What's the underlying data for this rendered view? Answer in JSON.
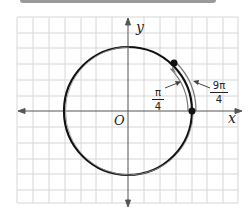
{
  "diagram": {
    "type": "unit-circle-angle",
    "axes": {
      "x_label": "x",
      "y_label": "y",
      "origin_label": "O"
    },
    "grid": {
      "columns": 14,
      "rows": 12
    },
    "angles": [
      {
        "label_num": "π",
        "label_den": "4",
        "meaning": "inner arc from positive x-axis to point"
      },
      {
        "label_num": "9π",
        "label_den": "4",
        "meaning": "outer arc, one full revolution plus π/4"
      }
    ],
    "points": [
      {
        "name": "start",
        "position": "(1, 0) on circle"
      },
      {
        "name": "terminal",
        "position": "angle π/4 on circle"
      }
    ],
    "colors": {
      "circle": "#111111",
      "arc": "#777777",
      "grid": "#d4d4d4",
      "axis": "#555555"
    }
  }
}
